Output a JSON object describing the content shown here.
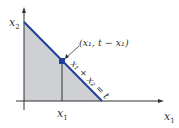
{
  "diagram": {
    "axis_x_label": "x",
    "axis_x_sub": "1",
    "axis_y_label": "x",
    "axis_y_sub": "2",
    "tick_label": "x",
    "tick_sub": "1",
    "point_label": "(x₁, t − x₁)",
    "line_label": "x₁ + x₂ = t",
    "colors": {
      "line": "#1f3f9a",
      "point": "#1f3f9a",
      "fill": "#cfd0d4",
      "axis": "#333333"
    }
  }
}
